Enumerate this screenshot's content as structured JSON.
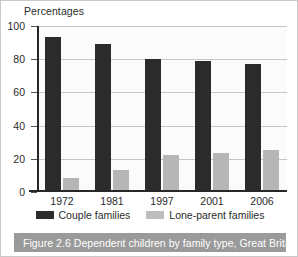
{
  "figure": {
    "caption": "Figure 2.6 Dependent children by family type, Great Britain",
    "caption_bar_color": "#9a9a9a",
    "caption_text_color": "#ffffff"
  },
  "chart_data": {
    "type": "bar",
    "title": "",
    "ylabel": "Percentages",
    "xlabel": "",
    "categories": [
      "1972",
      "1981",
      "1997",
      "2001",
      "2006"
    ],
    "series": [
      {
        "name": "Couple families",
        "color": "#2b2b2b",
        "values": [
          92,
          88,
          79,
          78,
          76
        ]
      },
      {
        "name": "Lone-parent families",
        "color": "#b6b6b6",
        "values": [
          7,
          12,
          21,
          22,
          24
        ]
      }
    ],
    "ylim": [
      0,
      100
    ],
    "yticks": [
      0,
      20,
      40,
      60,
      80,
      100
    ],
    "ytick_labels": [
      "0",
      "20",
      "40",
      "60",
      "80",
      "100"
    ],
    "grid": true,
    "legend_position": "bottom"
  }
}
